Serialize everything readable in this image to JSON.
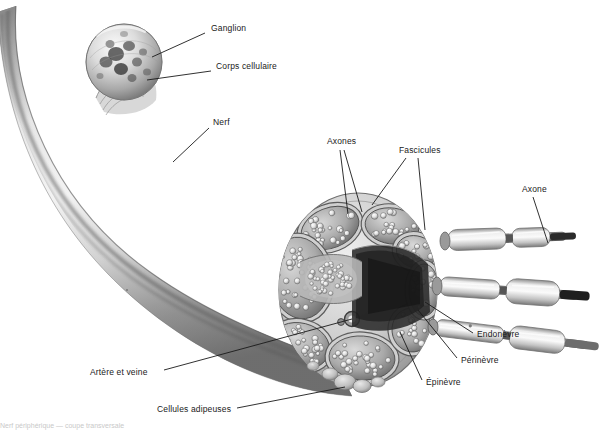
{
  "figure": {
    "title": "Nerf périphérique — coupe transversale",
    "background_color": "#ffffff",
    "ink_color": "#1a1a1a",
    "style": "grayscale anatomical illustration"
  },
  "labels": [
    {
      "id": "ganglion",
      "text": "Ganglion",
      "x": 211,
      "y": 30,
      "anchor": "start"
    },
    {
      "id": "corps-cellulaire",
      "text": "Corps cellulaire",
      "x": 216,
      "y": 68,
      "anchor": "start"
    },
    {
      "id": "nerf",
      "text": "Nerf",
      "x": 213,
      "y": 124,
      "anchor": "start"
    },
    {
      "id": "axones",
      "text": "Axones",
      "x": 327,
      "y": 143,
      "anchor": "start"
    },
    {
      "id": "fascicules",
      "text": "Fascicules",
      "x": 399,
      "y": 152,
      "anchor": "start"
    },
    {
      "id": "axone",
      "text": "Axone",
      "x": 522,
      "y": 191,
      "anchor": "start"
    },
    {
      "id": "endonevre",
      "text": "Endonèvre",
      "x": 477,
      "y": 336,
      "anchor": "start"
    },
    {
      "id": "perinevre",
      "text": "Périnèvre",
      "x": 461,
      "y": 362,
      "anchor": "start"
    },
    {
      "id": "epinevre",
      "text": "Épinèvre",
      "x": 426,
      "y": 384,
      "anchor": "start"
    },
    {
      "id": "artere-et-veine",
      "text": "Artère et veine",
      "x": 90,
      "y": 374,
      "anchor": "start"
    },
    {
      "id": "cellules-adipeuses",
      "text": "Cellules adipeuses",
      "x": 157,
      "y": 411,
      "anchor": "start"
    }
  ],
  "leaders": [
    {
      "id": "leader-ganglion",
      "points": "205,33 152,57"
    },
    {
      "id": "leader-corps-cellulaire",
      "points": "211,71 147,80"
    },
    {
      "id": "leader-nerf",
      "points": "209,128 173,162"
    },
    {
      "id": "leader-axones-a",
      "points": "340,150 348,214"
    },
    {
      "id": "leader-axones-b",
      "points": "344,150 362,212"
    },
    {
      "id": "leader-fascicules-a",
      "points": "406,158 372,205"
    },
    {
      "id": "leader-fascicules-b",
      "points": "418,158 425,230"
    },
    {
      "id": "leader-axone",
      "points": "533,197 548,243"
    },
    {
      "id": "leader-endonevre",
      "points": "473,333 425,302"
    },
    {
      "id": "leader-perinevre",
      "points": "457,358 418,310"
    },
    {
      "id": "leader-epinevre",
      "points": "422,380 400,332"
    },
    {
      "id": "leader-artere-et-veine",
      "points": "164,370 352,319"
    },
    {
      "id": "leader-cellules-adipeuses",
      "points": "237,408 345,387"
    }
  ],
  "structures": {
    "ganglion": {
      "cx": 124,
      "cy": 62,
      "r": 38,
      "cell_body_spots": 11
    },
    "nerve_trunk": "curved tapering cylinder running from upper-left down to the right cross-section face",
    "cross_section": {
      "cx": 358,
      "cy": 290,
      "rx": 78,
      "ry": 96
    },
    "fascicle_count": 8,
    "myelinated_axons_count": 3,
    "artery_vein": {
      "cx": 352,
      "cy": 319,
      "r": 7
    },
    "fat_cells": "rounded adipose lobules along lower outer rim of epineurium"
  },
  "bottom_caption": "Cellules adipeuses"
}
